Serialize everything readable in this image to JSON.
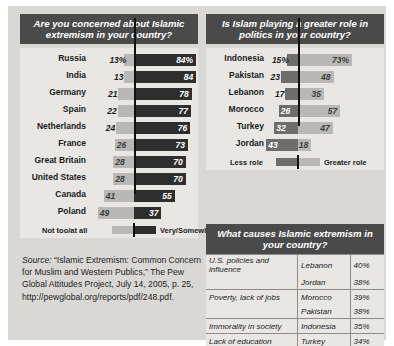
{
  "chart_data": [
    {
      "type": "bar",
      "title": "Are you concerned about Islamic extremism in your country?",
      "orientation": "diverging-horizontal",
      "categories": [
        "Russia",
        "India",
        "Germany",
        "Spain",
        "Netherlands",
        "France",
        "Great Britain",
        "United States",
        "Canada",
        "Poland"
      ],
      "series": [
        {
          "name": "Not too/at all",
          "values": [
            13,
            13,
            21,
            22,
            24,
            26,
            28,
            28,
            41,
            49
          ],
          "side": "left",
          "color": "#b9b8b4"
        },
        {
          "name": "Very/Somewhat",
          "values": [
            84,
            84,
            78,
            77,
            76,
            73,
            70,
            70,
            55,
            37
          ],
          "side": "right",
          "color": "#2e2e2e"
        }
      ],
      "value_labels_left": [
        "13%",
        "13",
        "21",
        "22",
        "24",
        "26",
        "28",
        "28",
        "41",
        "49"
      ],
      "value_labels_right": [
        "84%",
        "84",
        "78",
        "77",
        "76",
        "73",
        "70",
        "70",
        "55",
        "37"
      ],
      "legend": {
        "left": "Not too/at all",
        "right": "Very/Somewhat",
        "position": "bottom"
      },
      "xlabel": "",
      "ylabel": "",
      "grid": false
    },
    {
      "type": "bar",
      "title": "Is Islam playing a greater role in politics in your country?",
      "orientation": "diverging-horizontal",
      "categories": [
        "Indonesia",
        "Pakistan",
        "Lebanon",
        "Morocco",
        "Turkey",
        "Jordan"
      ],
      "series": [
        {
          "name": "Less role",
          "values": [
            15,
            23,
            17,
            26,
            32,
            43
          ],
          "side": "left",
          "color": "#6e6d69"
        },
        {
          "name": "Greater role",
          "values": [
            73,
            48,
            35,
            57,
            47,
            18
          ],
          "side": "right",
          "color": "#b9b8b4"
        }
      ],
      "value_labels_left": [
        "15%",
        "23",
        "17",
        "26",
        "32",
        "43"
      ],
      "value_labels_right": [
        "73%",
        "48",
        "35",
        "57",
        "47",
        "18"
      ],
      "legend": {
        "left": "Less role",
        "right": "Greater role",
        "position": "bottom"
      },
      "xlabel": "",
      "ylabel": "",
      "grid": false
    },
    {
      "type": "table",
      "title": "What causes Islamic extremism in your country?",
      "columns": [
        "cause",
        "country",
        "percent"
      ],
      "rows": [
        {
          "cause": "U.S. policies and influence",
          "country": "Lebanon",
          "percent": "40%",
          "group_start": true
        },
        {
          "cause": "",
          "country": "Jordan",
          "percent": "38%",
          "group_start": false
        },
        {
          "cause": "Poverty, lack of jobs",
          "country": "Morocco",
          "percent": "39%",
          "group_start": true
        },
        {
          "cause": "",
          "country": "Pakistan",
          "percent": "38%",
          "group_start": false
        },
        {
          "cause": "Immorality in society",
          "country": "Indonesia",
          "percent": "35%",
          "group_start": true
        },
        {
          "cause": "Lack of education",
          "country": "Turkey",
          "percent": "34%",
          "group_start": true
        }
      ]
    }
  ],
  "panels": {
    "left_title": "Are you concerned about Islamic extremism in your country?",
    "right_title": "Is Islam playing a greater role in politics in your country?",
    "table_title": "What causes Islamic extremism in your country?"
  },
  "source": {
    "label": "Source:",
    "text": " “Islamic Extremism: Common Concern for Muslim and Western Publics,” The Pew Global Attitudes Project, July 14, 2005, p. 25, http://pewglobal.org/reports/pdf/248.pdf."
  },
  "colors": {
    "page_background": "#ffffff",
    "sheet_background": "#d9d8d4",
    "chart_background": "#e8e7e3",
    "header_background": "#4a4a4a",
    "header_text": "#ffffff",
    "dark_bar": "#2e2e2e",
    "mid_bar": "#6e6d69",
    "light_bar": "#b9b8b4",
    "axis": "#111111",
    "rule": "#8d8c88"
  }
}
